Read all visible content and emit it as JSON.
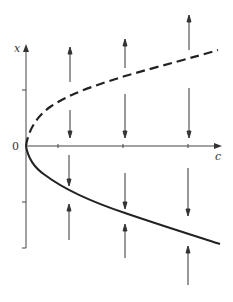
{
  "diagram": {
    "type": "bifurcation-diagram",
    "axis_labels": {
      "vertical": "x",
      "horizontal": "c",
      "origin": "0"
    },
    "colors": {
      "stroke": "#222222",
      "axis": "#444444",
      "arrow": "#333333"
    },
    "branches": [
      {
        "name": "unstable-branch",
        "style": "dashed",
        "description": "upper branch x = +sqrt(c)"
      },
      {
        "name": "stable-branch",
        "style": "solid",
        "description": "lower branch x = -sqrt(c)"
      }
    ],
    "flow_arrows": [
      {
        "column": 1,
        "upper": "away-from-dashed",
        "lower": "toward-solid"
      },
      {
        "column": 2,
        "upper": "away-from-dashed",
        "lower": "toward-solid"
      },
      {
        "column": 3,
        "upper": "away-from-dashed",
        "lower": "toward-solid"
      }
    ]
  }
}
